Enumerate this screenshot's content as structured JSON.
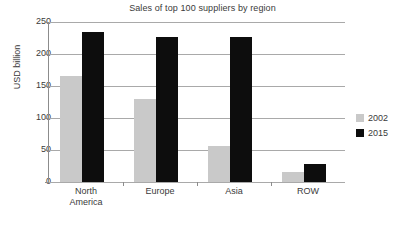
{
  "chart_data": {
    "type": "bar",
    "title": "Sales of top 100 suppliers by region",
    "xlabel": "",
    "ylabel": "USD billion",
    "categories": [
      "North\nAmerica",
      "Europe",
      "Asia",
      "ROW"
    ],
    "series": [
      {
        "name": "2002",
        "color": "#c9c9c9",
        "values": [
          165,
          129,
          56,
          16
        ]
      },
      {
        "name": "2015",
        "color": "#0d0d0d",
        "values": [
          235,
          226,
          227,
          28
        ]
      }
    ],
    "ylim": [
      0,
      250
    ],
    "yticks": [
      0,
      50,
      100,
      150,
      200,
      250
    ],
    "ytick_labels": [
      "0",
      "50",
      "100",
      "150",
      "200",
      "250"
    ],
    "grid": true,
    "legend_position": "right"
  },
  "legend": {
    "entries": [
      {
        "label": "2002"
      },
      {
        "label": "2015"
      }
    ]
  }
}
